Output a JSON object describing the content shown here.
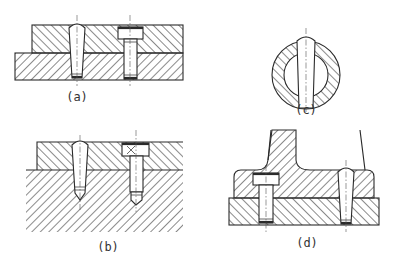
{
  "figure": {
    "colors": {
      "line": "#2a2a2a",
      "background": "#ffffff",
      "centerline": "#555555"
    },
    "subfigures": [
      {
        "id": "a",
        "label": "(a)",
        "content": "Two hatched plates joined by a taper pin (left) and a socket head screw (right), both through-holes"
      },
      {
        "id": "b",
        "label": "(b)",
        "content": "Plate on a thick hatched base with taper pin (left) and screw (right) in blind holes"
      },
      {
        "id": "c",
        "label": "(c)",
        "content": "Circular hatched ring with taper pin passing through its diameter"
      },
      {
        "id": "d",
        "label": "(d)",
        "content": "Bracket with column on base plate, fastened by screw (left) and taper pin (right)"
      }
    ]
  }
}
